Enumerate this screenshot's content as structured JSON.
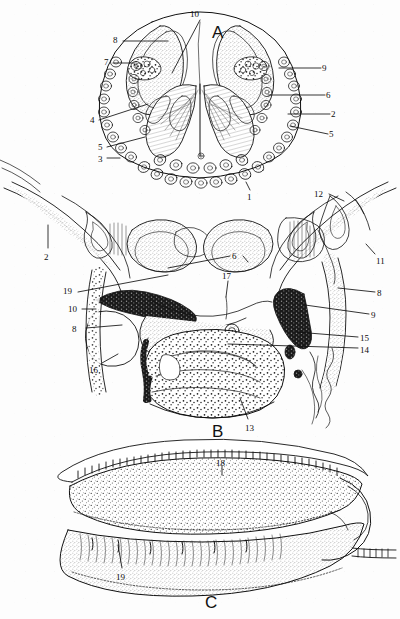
{
  "figure": {
    "background_color": "#fdfdfd",
    "ink_color": "#111111",
    "panels": [
      {
        "id": "A",
        "letter": "A",
        "letter_x": 212,
        "letter_y": 24,
        "caption": "A"
      },
      {
        "id": "B",
        "letter": "B",
        "letter_x": 212,
        "letter_y": 423,
        "caption": "B"
      },
      {
        "id": "C",
        "letter": "C",
        "letter_x": 205,
        "letter_y": 594,
        "caption": "C"
      }
    ],
    "labels": [
      {
        "panel": "A",
        "text": "10",
        "x": 190,
        "y": 10,
        "leader": [
          [
            200,
            20
          ],
          [
            172,
            73
          ]
        ]
      },
      {
        "panel": "A",
        "text": "8",
        "x": 113,
        "y": 36,
        "leader": [
          [
            123,
            41
          ],
          [
            168,
            41
          ]
        ]
      },
      {
        "panel": "A",
        "text": "7",
        "x": 104,
        "y": 58,
        "leader": [
          [
            113,
            63
          ],
          [
            135,
            63
          ]
        ]
      },
      {
        "panel": "A",
        "text": "9",
        "x": 322,
        "y": 64,
        "leader": [
          [
            321,
            68
          ],
          [
            279,
            68
          ]
        ]
      },
      {
        "panel": "A",
        "text": "6",
        "x": 326,
        "y": 91,
        "leader": [
          [
            325,
            95
          ],
          [
            268,
            95
          ]
        ]
      },
      {
        "panel": "A",
        "text": "2",
        "x": 331,
        "y": 110,
        "leader": [
          [
            330,
            114
          ],
          [
            288,
            114
          ]
        ]
      },
      {
        "panel": "A",
        "text": "5",
        "x": 329,
        "y": 130,
        "leader": [
          [
            328,
            134
          ],
          [
            290,
            126
          ]
        ]
      },
      {
        "panel": "A",
        "text": "4",
        "x": 90,
        "y": 116,
        "leader": [
          [
            99,
            120
          ],
          [
            148,
            104
          ]
        ]
      },
      {
        "panel": "A",
        "text": "5",
        "x": 98,
        "y": 143,
        "leader": [
          [
            107,
            147
          ],
          [
            145,
            137
          ]
        ]
      },
      {
        "panel": "A",
        "text": "3",
        "x": 98,
        "y": 155,
        "leader": [
          [
            107,
            158
          ],
          [
            120,
            158
          ]
        ]
      },
      {
        "panel": "A",
        "text": "1",
        "x": 247,
        "y": 193,
        "leader": [
          [
            250,
            190
          ],
          [
            246,
            182
          ]
        ]
      },
      {
        "panel": "B",
        "text": "12",
        "x": 314,
        "y": 190,
        "leader": [
          [
            329,
            194
          ],
          [
            344,
            201
          ]
        ]
      },
      {
        "panel": "B",
        "text": "2",
        "x": 44,
        "y": 253,
        "leader": [
          [
            48,
            248
          ],
          [
            48,
            225
          ]
        ]
      },
      {
        "panel": "B",
        "text": "11",
        "x": 376,
        "y": 257,
        "leader": [
          [
            375,
            254
          ],
          [
            366,
            244
          ]
        ]
      },
      {
        "panel": "B",
        "text": "6",
        "x": 232,
        "y": 252,
        "leader": [
          [
            230,
            256
          ],
          [
            168,
            268
          ]
        ]
      },
      {
        "panel": "B",
        "text": "6b",
        "x": 232,
        "y": 252,
        "leader": [
          [
            243,
            256
          ],
          [
            248,
            262
          ]
        ]
      },
      {
        "panel": "B",
        "text": "17",
        "x": 222,
        "y": 272,
        "leader": [
          [
            228,
            281
          ],
          [
            226,
            297
          ]
        ]
      },
      {
        "panel": "B",
        "text": "8",
        "x": 377,
        "y": 289,
        "leader": [
          [
            375,
            292
          ],
          [
            338,
            288
          ]
        ]
      },
      {
        "panel": "B",
        "text": "19",
        "x": 63,
        "y": 287,
        "leader": [
          [
            78,
            292
          ],
          [
            168,
            275
          ]
        ]
      },
      {
        "panel": "B",
        "text": "9",
        "x": 371,
        "y": 311,
        "leader": [
          [
            369,
            314
          ],
          [
            305,
            305
          ]
        ]
      },
      {
        "panel": "B",
        "text": "10",
        "x": 68,
        "y": 305,
        "leader": [
          [
            82,
            309
          ],
          [
            96,
            309
          ]
        ]
      },
      {
        "panel": "B",
        "text": "8",
        "x": 72,
        "y": 325,
        "leader": [
          [
            86,
            328
          ],
          [
            122,
            325
          ]
        ]
      },
      {
        "panel": "B",
        "text": "15",
        "x": 360,
        "y": 334,
        "leader": [
          [
            358,
            337
          ],
          [
            296,
            332
          ]
        ]
      },
      {
        "panel": "B",
        "text": "14",
        "x": 360,
        "y": 346,
        "leader": [
          [
            358,
            348
          ],
          [
            228,
            344
          ]
        ]
      },
      {
        "panel": "B",
        "text": "16",
        "x": 89,
        "y": 366,
        "leader": [
          [
            102,
            363
          ],
          [
            118,
            354
          ]
        ]
      },
      {
        "panel": "B",
        "text": "13",
        "x": 245,
        "y": 424,
        "leader": [
          [
            248,
            419
          ],
          [
            240,
            398
          ]
        ]
      },
      {
        "panel": "C",
        "text": "18",
        "x": 216,
        "y": 459,
        "leader": [
          [
            222,
            466
          ],
          [
            222,
            475
          ]
        ]
      },
      {
        "panel": "C",
        "text": "19",
        "x": 116,
        "y": 573,
        "leader": [
          [
            122,
            568
          ],
          [
            118,
            545
          ]
        ]
      }
    ]
  }
}
